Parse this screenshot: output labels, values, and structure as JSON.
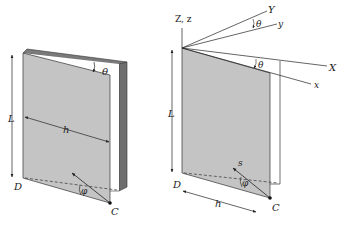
{
  "figure": {
    "left_panel": {
      "labels": {
        "length": "L",
        "width": "h",
        "angle_theta": "θ",
        "angle_phi": "φ",
        "corner_d": "D",
        "corner_c": "C"
      }
    },
    "right_panel": {
      "labels": {
        "vertical_axes": "Z, z",
        "axis_Y": "Y",
        "axis_y": "y",
        "axis_X": "X",
        "axis_x": "x",
        "angle_theta_top": "θ",
        "angle_theta_side": "θ",
        "length": "L",
        "width": "h",
        "vector_s": "s",
        "angle_phi": "φ",
        "corner_d": "D",
        "corner_c": "C"
      }
    },
    "colors": {
      "page_fill": "#c4c4c4",
      "cover_fill": "#6e6e6e",
      "cover_edge": "#8a8a8a",
      "line": "#222222",
      "background": "#ffffff"
    }
  }
}
